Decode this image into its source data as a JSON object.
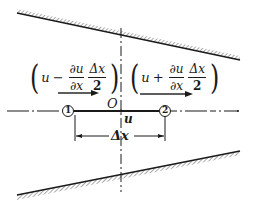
{
  "diagram": {
    "origin_label": "O",
    "velocity_label": "u",
    "spacing_label": "Δx",
    "point_1_label": "1",
    "point_2_label": "2",
    "left_expression": {
      "var": "u",
      "operator": "−",
      "partial_num": "∂u",
      "partial_den": "∂x",
      "delta_num": "Δx",
      "delta_den": "2"
    },
    "right_expression": {
      "var": "u",
      "operator": "+",
      "partial_num": "∂u",
      "partial_den": "∂x",
      "delta_num": "Δx",
      "delta_den": "2"
    },
    "colors": {
      "line": "#1a1a1a",
      "background": "#ffffff"
    }
  }
}
